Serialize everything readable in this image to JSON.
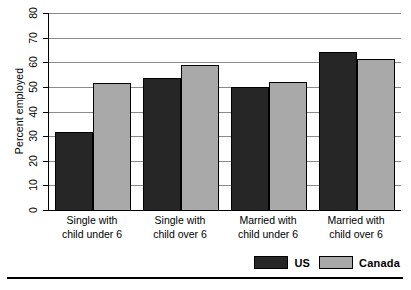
{
  "chart_data": {
    "type": "bar",
    "title": "",
    "xlabel": "",
    "ylabel": "Percent employed",
    "ylim": [
      0,
      80
    ],
    "yticks": [
      0,
      10,
      20,
      30,
      40,
      50,
      60,
      70,
      80
    ],
    "grid": true,
    "legend_position": "bottom-right",
    "categories": [
      "Single with child under 6",
      "Single with child over 6",
      "Married with child under 6",
      "Married with child over 6"
    ],
    "category_lines": [
      {
        "line1": "Single with",
        "line2": "child under 6"
      },
      {
        "line1": "Single with",
        "line2": "child over 6"
      },
      {
        "line1": "Married with",
        "line2": "child under 6"
      },
      {
        "line1": "Married with",
        "line2": "child over 6"
      }
    ],
    "series": [
      {
        "name": "US",
        "color": "#262626",
        "values": [
          31.5,
          53.5,
          50.0,
          64.0
        ]
      },
      {
        "name": "Canada",
        "color": "#a9a9a9",
        "values": [
          51.5,
          59.0,
          52.0,
          61.5
        ]
      }
    ]
  },
  "legend": {
    "items": [
      {
        "label": "US",
        "color": "#262626"
      },
      {
        "label": "Canada",
        "color": "#a9a9a9"
      }
    ]
  },
  "colors": {
    "us": "#262626",
    "canada": "#a9a9a9",
    "gridline": "#8a8a8a",
    "axis": "#000000",
    "background": "#ffffff"
  }
}
